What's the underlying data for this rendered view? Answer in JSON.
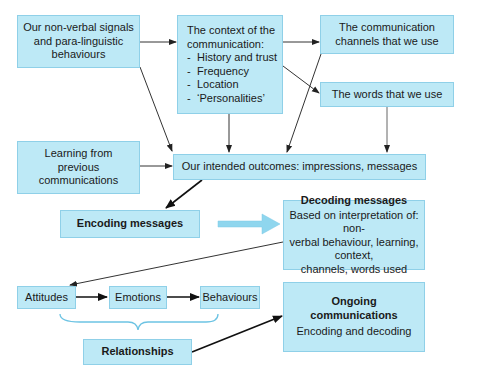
{
  "diagram": {
    "nodes": {
      "nonverbal": {
        "lines": [
          "Our non-verbal signals",
          "and para-linguistic",
          "behaviours"
        ]
      },
      "context": {
        "title_lines": [
          "The context of the",
          "communication:"
        ],
        "items": [
          "History and trust",
          "Frequency",
          "Location",
          "‘Personalities’"
        ]
      },
      "channels": {
        "lines": [
          "The communication",
          "channels that we use"
        ]
      },
      "words": {
        "label": "The words that we use"
      },
      "learning": {
        "lines": [
          "Learning from",
          "previous",
          "communications"
        ]
      },
      "outcomes": {
        "label": "Our intended outcomes: impressions, messages"
      },
      "encoding": {
        "label": "Encoding messages"
      },
      "decoding": {
        "title": "Decoding messages",
        "lines": [
          "Based on interpretation of: non-",
          "verbal behaviour, learning, context,",
          "channels, words used"
        ]
      },
      "attitudes": {
        "label": "Attitudes"
      },
      "emotions": {
        "label": "Emotions"
      },
      "behaviours": {
        "label": "Behaviours"
      },
      "relationships": {
        "label": "Relationships"
      },
      "ongoing": {
        "title_lines": [
          "Ongoing",
          "communications"
        ],
        "subtitle": "Encoding and decoding"
      }
    },
    "edges": [
      {
        "from": "nonverbal",
        "to": "context"
      },
      {
        "from": "nonverbal",
        "to": "outcomes"
      },
      {
        "from": "context",
        "to": "channels"
      },
      {
        "from": "context",
        "to": "words"
      },
      {
        "from": "context",
        "to": "outcomes"
      },
      {
        "from": "channels",
        "to": "outcomes"
      },
      {
        "from": "words",
        "to": "outcomes"
      },
      {
        "from": "learning",
        "to": "outcomes"
      },
      {
        "from": "outcomes",
        "to": "encoding"
      },
      {
        "from": "encoding",
        "to": "decoding",
        "style": "block-arrow"
      },
      {
        "from": "decoding",
        "to": "attitudes"
      },
      {
        "from": "attitudes",
        "to": "emotions"
      },
      {
        "from": "emotions",
        "to": "behaviours"
      },
      {
        "from": "attitudes-emotions-behaviours",
        "to": "relationships",
        "style": "brace"
      },
      {
        "from": "relationships",
        "to": "ongoing"
      }
    ],
    "colors": {
      "box_fill": "#bde9f6",
      "box_border": "#8fd0e8",
      "line": "#333333",
      "block_arrow": "#8fd6ee",
      "brace": "#6cc3e3"
    }
  }
}
